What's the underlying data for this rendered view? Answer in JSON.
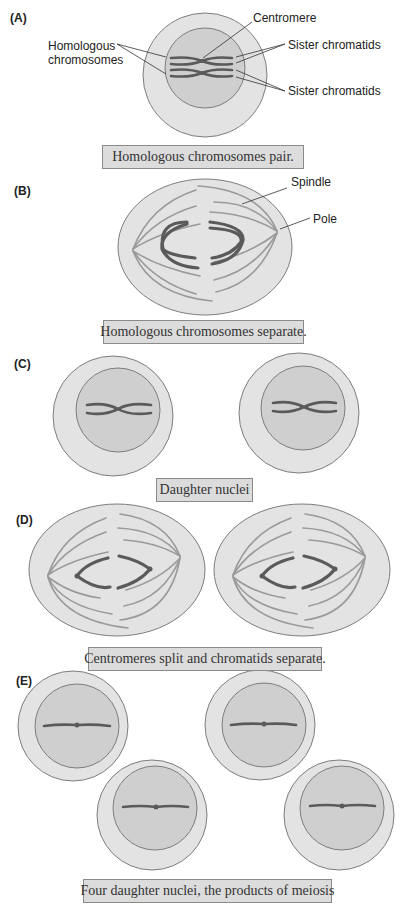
{
  "figure": {
    "panels": [
      {
        "id": "A",
        "label": "(A)",
        "caption": "Homologous chromosomes pair.",
        "callouts": {
          "centromere": "Centromere",
          "homologous_line1": "Homologous",
          "homologous_line2": "chromosomes",
          "sister_top": "Sister chromatids",
          "sister_bottom": "Sister chromatids"
        }
      },
      {
        "id": "B",
        "label": "(B)",
        "caption": "Homologous chromosomes separate.",
        "callouts": {
          "spindle": "Spindle",
          "pole": "Pole"
        }
      },
      {
        "id": "C",
        "label": "(C)",
        "caption": "Daughter nuclei"
      },
      {
        "id": "D",
        "label": "(D)",
        "caption": "Centromeres split and chromatids separate."
      },
      {
        "id": "E",
        "label": "(E)",
        "caption": "Four daughter nuclei, the products of meiosis"
      }
    ],
    "colors": {
      "cytoplasm": "#e3e3e3",
      "nucleus": "#cfcfcf",
      "chromosome": "#5a5a5a",
      "spindle": "#9a9a9a",
      "caption_bg": "#dcdcdc",
      "outline": "#7d7d7d"
    }
  }
}
